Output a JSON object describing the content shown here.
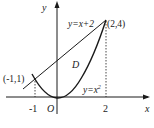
{
  "diagram": {
    "axes": {
      "x_label": "x",
      "y_label": "y",
      "origin_label": "O",
      "x_ticks": [
        "-1",
        "2"
      ]
    },
    "curves": [
      {
        "name": "line",
        "equation": "y=x+2"
      },
      {
        "name": "parabola",
        "equation": "y=x",
        "equation_sup": "2"
      }
    ],
    "points": [
      {
        "label": "(-1,1)",
        "x": -1,
        "y": 1
      },
      {
        "label": "(2,4)",
        "x": 2,
        "y": 4
      }
    ],
    "region_label": "D",
    "colors": {
      "stroke": "#1a1a1a",
      "background": "#ffffff"
    }
  }
}
